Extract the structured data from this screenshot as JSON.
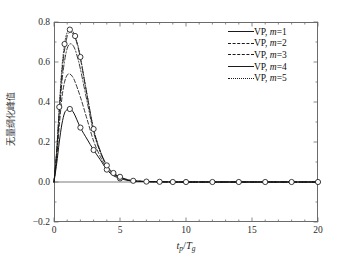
{
  "chart_data": {
    "type": "line",
    "title": "",
    "xlabel": "t_p/T_g",
    "xlabel_parts": {
      "base1": "t",
      "sub1": "p",
      "slash": "/",
      "base2": "T",
      "sub2": "g"
    },
    "ylabel": "无量纲化峰值",
    "xlim": [
      0,
      20
    ],
    "ylim": [
      -0.2,
      0.8
    ],
    "xticks": [
      0,
      5,
      10,
      15,
      20
    ],
    "xtick_labels": [
      "0",
      "5",
      "10",
      "15",
      "20"
    ],
    "xminor_step": 1,
    "yticks": [
      -0.2,
      0.0,
      0.2,
      0.4,
      0.6,
      0.8
    ],
    "ytick_labels": [
      "-0.2",
      "0.0",
      "0.2",
      "0.4",
      "0.6",
      "0.8"
    ],
    "yminor_step": 0.1,
    "grid": false,
    "legend_position": "upper-right",
    "marker": "open-circle",
    "marker_series": "VP, m=5",
    "zero_line": true,
    "series": [
      {
        "name": "VP, m=1",
        "style": "solid",
        "color": "#141414",
        "x": [
          0,
          0.2,
          0.4,
          0.6,
          0.8,
          1.0,
          1.2,
          1.5,
          2.0,
          2.5,
          3.0,
          3.5,
          4.0,
          4.5,
          5.0,
          5.5,
          6.0,
          7.0,
          8.0,
          9.0,
          10.0,
          12.0,
          14.0,
          16.0,
          18.0,
          20.0
        ],
        "y": [
          0.0,
          0.09,
          0.2,
          0.29,
          0.345,
          0.362,
          0.365,
          0.345,
          0.272,
          0.215,
          0.16,
          0.112,
          0.062,
          0.032,
          0.018,
          0.009,
          0.005,
          0.002,
          0.001,
          0.0,
          0.0,
          0.0,
          0.0,
          0.0,
          0.0,
          0.0
        ]
      },
      {
        "name": "VP, m=2",
        "style": "dashed",
        "color": "#141414",
        "x": [
          0,
          0.2,
          0.4,
          0.6,
          0.8,
          1.0,
          1.2,
          1.4,
          1.6,
          2.0,
          2.5,
          3.0,
          3.5,
          4.0,
          4.5,
          5.0,
          5.5,
          6.0,
          7.0,
          8.0,
          9.0,
          10.0,
          12.0,
          14.0,
          16.0,
          18.0,
          20.0
        ],
        "y": [
          0.0,
          0.12,
          0.28,
          0.42,
          0.5,
          0.535,
          0.54,
          0.527,
          0.5,
          0.425,
          0.315,
          0.205,
          0.128,
          0.07,
          0.038,
          0.022,
          0.011,
          0.006,
          0.002,
          0.001,
          0.0,
          0.0,
          0.0,
          0.0,
          0.0,
          0.0,
          0.0
        ]
      },
      {
        "name": "VP, m=3",
        "style": "dashdot",
        "color": "#141414",
        "x": [
          0,
          0.2,
          0.4,
          0.6,
          0.8,
          1.0,
          1.2,
          1.4,
          1.6,
          1.8,
          2.0,
          2.5,
          3.0,
          3.5,
          4.0,
          4.5,
          5.0,
          5.5,
          6.0,
          7.0,
          8.0,
          9.0,
          10.0,
          12.0,
          14.0,
          16.0,
          18.0,
          20.0
        ],
        "y": [
          0.0,
          0.14,
          0.33,
          0.5,
          0.605,
          0.668,
          0.69,
          0.686,
          0.662,
          0.618,
          0.565,
          0.405,
          0.25,
          0.15,
          0.08,
          0.042,
          0.024,
          0.012,
          0.006,
          0.002,
          0.001,
          0.0,
          0.0,
          0.0,
          0.0,
          0.0,
          0.0,
          0.0
        ]
      },
      {
        "name": "VP, m=4",
        "style": "longdash",
        "color": "#141414",
        "x": [
          0,
          0.2,
          0.4,
          0.6,
          0.8,
          1.0,
          1.2,
          1.4,
          1.6,
          1.8,
          2.0,
          2.5,
          3.0,
          3.5,
          4.0,
          4.5,
          5.0,
          5.5,
          6.0,
          7.0,
          8.0,
          9.0,
          10.0,
          12.0,
          14.0,
          16.0,
          18.0,
          20.0
        ],
        "y": [
          0.0,
          0.15,
          0.36,
          0.545,
          0.66,
          0.728,
          0.748,
          0.745,
          0.722,
          0.678,
          0.618,
          0.435,
          0.262,
          0.155,
          0.082,
          0.044,
          0.025,
          0.013,
          0.006,
          0.002,
          0.001,
          0.0,
          0.0,
          0.0,
          0.0,
          0.0,
          0.0,
          0.0
        ]
      },
      {
        "name": "VP, m=5",
        "style": "dotted",
        "color": "#141414",
        "x": [
          0,
          0.2,
          0.4,
          0.6,
          0.8,
          1.0,
          1.2,
          1.4,
          1.6,
          1.8,
          2.0,
          2.5,
          3.0,
          3.5,
          4.0,
          4.5,
          5.0,
          5.5,
          6.0,
          7.0,
          8.0,
          9.0,
          10.0,
          12.0,
          14.0,
          16.0,
          18.0,
          20.0
        ],
        "y": [
          0.0,
          0.155,
          0.375,
          0.57,
          0.69,
          0.748,
          0.762,
          0.755,
          0.73,
          0.685,
          0.625,
          0.44,
          0.265,
          0.157,
          0.083,
          0.045,
          0.026,
          0.013,
          0.006,
          0.002,
          0.001,
          0.0,
          0.0,
          0.0,
          0.0,
          0.0,
          0.0,
          0.0
        ]
      }
    ],
    "markers": {
      "x": [
        0.4,
        0.8,
        1.2,
        1.6,
        2.0,
        3.0,
        4.0,
        4.5,
        5.0,
        6.0,
        7.0,
        8.0,
        9.0,
        10.0,
        12.0,
        14.0,
        16.0,
        18.0,
        20.0
      ],
      "y": [
        0.375,
        0.69,
        0.762,
        0.73,
        0.625,
        0.265,
        0.083,
        0.045,
        0.026,
        0.006,
        0.002,
        0.001,
        0.0,
        0.0,
        0.0,
        0.0,
        0.0,
        0.0,
        0.0
      ]
    },
    "markers_lower": {
      "x": [
        1.2,
        2.0,
        3.0,
        4.0,
        5.0
      ],
      "y": [
        0.365,
        0.272,
        0.16,
        0.062,
        0.018
      ]
    }
  },
  "legend": {
    "items": [
      {
        "label": "VP, m=1",
        "prefix": "VP, ",
        "var": "m",
        "eq": "=1"
      },
      {
        "label": "VP, m=2",
        "prefix": "VP, ",
        "var": "m",
        "eq": "=2"
      },
      {
        "label": "VP, m=3",
        "prefix": "VP, ",
        "var": "m",
        "eq": "=3"
      },
      {
        "label": "VP, m=4",
        "prefix": "VP, ",
        "var": "m",
        "eq": "=4"
      },
      {
        "label": "VP, m=5",
        "prefix": "VP, ",
        "var": "m",
        "eq": "=5"
      }
    ]
  }
}
